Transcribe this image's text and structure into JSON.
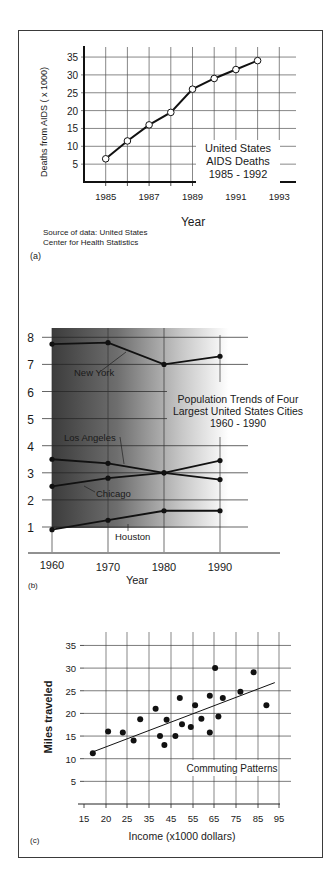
{
  "page": {
    "panel_labels": [
      "(a)",
      "(b)",
      "(c)"
    ]
  },
  "chart_data": [
    {
      "id": "a",
      "type": "line",
      "title": "United States AIDS Deaths 1985 - 1992",
      "title_lines": [
        "United States",
        "AIDS Deaths",
        "1985 - 1992"
      ],
      "xlabel": "Year",
      "ylabel": "Deaths from AIDS  ( x 1000)",
      "x": [
        1985,
        1986,
        1987,
        1988,
        1989,
        1990,
        1991,
        1992
      ],
      "values": [
        6.5,
        11.5,
        16,
        19.5,
        26,
        29,
        31.5,
        34
      ],
      "x_tick_labels": [
        "1985",
        "1987",
        "1989",
        "1991",
        "1993"
      ],
      "y_tick_labels": [
        "5",
        "10",
        "15",
        "20",
        "25",
        "30",
        "35"
      ],
      "xlim": [
        1984,
        1993.6
      ],
      "ylim": [
        0,
        37
      ],
      "grid": true,
      "marker": "open-circle",
      "source_lines": [
        "Source of data: United States",
        "Center for Health Statistics"
      ],
      "panel_label": "(a)"
    },
    {
      "id": "b",
      "type": "line",
      "title": "Population Trends of Four Largest United States Cities 1960 - 1990",
      "title_lines": [
        "Population Trends of Four",
        "Largest United States Cities",
        "1960 - 1990"
      ],
      "xlabel": "Year",
      "ylabel": "",
      "categories": [
        "1960",
        "1970",
        "1980",
        "1990"
      ],
      "series": [
        {
          "name": "New York",
          "values": [
            7.75,
            7.8,
            7.0,
            7.3
          ]
        },
        {
          "name": "Los Angeles",
          "values": [
            3.5,
            3.35,
            3.0,
            2.75
          ]
        },
        {
          "name": "Chicago",
          "values": [
            2.5,
            2.8,
            3.0,
            3.45
          ]
        },
        {
          "name": "Houston",
          "values": [
            0.9,
            1.25,
            1.6,
            1.6
          ]
        }
      ],
      "y_tick_labels": [
        "1",
        "2",
        "3",
        "4",
        "5",
        "6",
        "7",
        "8"
      ],
      "ylim": [
        0.5,
        8.3
      ],
      "grid": true,
      "background": "dark-to-light gradient",
      "panel_label": "(b)"
    },
    {
      "id": "c",
      "type": "scatter",
      "title": "Commuting Patterns",
      "xlabel": "Income (x1000 dollars)",
      "ylabel": "Miles traveled",
      "x_tick_labels": [
        "15",
        "20",
        "25",
        "35",
        "45",
        "55",
        "65",
        "75",
        "85",
        "95"
      ],
      "y_tick_labels": [
        "5",
        "10",
        "15",
        "20",
        "25",
        "30",
        "35"
      ],
      "ylim": [
        0,
        37
      ],
      "grid": true,
      "points": [
        {
          "x": 17,
          "y": 11.2
        },
        {
          "x": 20.5,
          "y": 16
        },
        {
          "x": 24,
          "y": 15.8
        },
        {
          "x": 28,
          "y": 14
        },
        {
          "x": 31,
          "y": 18.7
        },
        {
          "x": 38,
          "y": 21
        },
        {
          "x": 40,
          "y": 15
        },
        {
          "x": 42,
          "y": 13
        },
        {
          "x": 43,
          "y": 18.6
        },
        {
          "x": 47,
          "y": 15
        },
        {
          "x": 49,
          "y": 23.4
        },
        {
          "x": 50,
          "y": 17.6
        },
        {
          "x": 54,
          "y": 17
        },
        {
          "x": 56,
          "y": 21.8
        },
        {
          "x": 59,
          "y": 18.8
        },
        {
          "x": 63,
          "y": 23.9
        },
        {
          "x": 63,
          "y": 15.8
        },
        {
          "x": 65.5,
          "y": 30
        },
        {
          "x": 67,
          "y": 19.3
        },
        {
          "x": 69,
          "y": 23.4
        },
        {
          "x": 77,
          "y": 24.8
        },
        {
          "x": 83,
          "y": 29.1
        },
        {
          "x": 89,
          "y": 21.8
        }
      ],
      "trendline": {
        "from": {
          "x": 17,
          "y": 11.5
        },
        "to": {
          "x": 93,
          "y": 26.8
        }
      },
      "panel_label": "(c)"
    }
  ]
}
